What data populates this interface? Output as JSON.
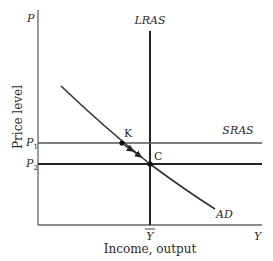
{
  "diagram": {
    "y_axis_label": "Price level",
    "y_axis_symbol": "P",
    "x_axis_label": "Income, output",
    "x_axis_symbol": "Y",
    "curves": {
      "lras": "LRAS",
      "sras": "SRAS",
      "ad": "AD"
    },
    "points": {
      "k": "K",
      "c": "C"
    },
    "price_levels": {
      "p1": {
        "base": "P",
        "sub": "1"
      },
      "p2": {
        "base": "P",
        "sub": "2"
      }
    },
    "natural_output": "Y",
    "colors": {
      "line": "#222222",
      "sras_line": "#555555",
      "axis": "#666666"
    }
  }
}
